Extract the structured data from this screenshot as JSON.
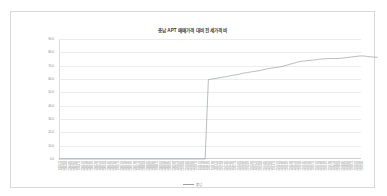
{
  "chart_data": {
    "type": "line",
    "title": "충남 APT 매매가격 대비 전세가격 비",
    "xlabel": "",
    "ylabel": "",
    "ylim": [
      0.0,
      90.0
    ],
    "yticks": [
      0.0,
      10.0,
      20.0,
      30.0,
      40.0,
      50.0,
      60.0,
      70.0,
      80.0,
      90.0
    ],
    "ytick_labels": [
      "0.0",
      "10.0",
      "20.0",
      "30.0",
      "40.0",
      "50.0",
      "60.0",
      "70.0",
      "80.0",
      "90.0"
    ],
    "grid": true,
    "legend_position": "bottom",
    "series": [
      {
        "name": "충남",
        "color": "#9aa0a6",
        "categories": [
          "2003.11",
          "2004.01",
          "2004.03",
          "2004.05",
          "2004.07",
          "2004.09",
          "2004.11",
          "2005.01",
          "2005.03",
          "2005.05",
          "2005.07",
          "2005.09",
          "2005.11",
          "2006.01",
          "2006.03",
          "2006.05",
          "2006.07",
          "2006.09",
          "2006.11",
          "2007.01",
          "2007.03",
          "2007.05",
          "2007.07",
          "2007.09",
          "2007.11",
          "2008.01",
          "2008.03",
          "2008.05",
          "2008.07",
          "2008.09",
          "2008.11",
          "2009.01",
          "2009.03",
          "2009.05",
          "2009.07",
          "2009.09",
          "2009.11",
          "2010.01",
          "2010.03",
          "2010.05",
          "2010.07",
          "2010.09",
          "2010.11",
          "2011.01",
          "2011.03",
          "2011.05",
          "2011.07",
          "2011.09",
          "2011.11",
          "2012.01",
          "2012.03",
          "2012.05",
          "2012.07",
          "2012.09",
          "2012.11",
          "2013.01",
          "2013.03",
          "2013.05",
          "2013.07",
          "2013.09",
          "2013.11",
          "2014.01",
          "2014.03",
          "2014.05",
          "2014.07",
          "2014.09",
          "2014.11",
          "2015.01",
          "2015.03",
          "2015.05",
          "2015.07",
          "2015.09",
          "2015.11",
          "2016.01",
          "2016.03",
          "2016.05",
          "2016.07",
          "2016.09",
          "2016.11",
          "2017.01",
          "2017.03",
          "2017.05",
          "2017.07",
          "2017.09",
          "2017.11",
          "2018.01",
          "2018.03",
          "2018.05",
          "2018.07",
          "2018.09",
          "2018.11",
          "2019.01",
          "2019.03",
          "2019.05"
        ],
        "values": [
          0,
          0,
          0,
          0,
          0,
          0,
          0,
          0,
          0,
          0,
          0,
          0,
          0,
          0,
          0,
          0,
          0,
          0,
          0,
          0,
          0,
          0,
          0,
          0,
          0,
          0,
          0,
          0,
          0,
          0,
          0,
          0,
          0,
          0,
          0,
          0,
          0,
          0,
          0,
          0,
          0,
          0,
          0,
          0,
          0,
          0,
          59.5,
          60.0,
          60.3,
          60.8,
          61.2,
          61.5,
          62.0,
          62.6,
          63.0,
          63.3,
          63.9,
          64.5,
          64.8,
          65.3,
          65.6,
          66.0,
          66.4,
          67.0,
          67.6,
          68.0,
          68.4,
          68.7,
          69.0,
          69.6,
          70.3,
          71.0,
          71.6,
          72.3,
          73.0,
          73.4,
          73.6,
          73.9,
          74.1,
          74.4,
          74.8,
          75.0,
          75.2,
          75.3,
          75.4,
          75.3,
          75.4,
          75.6,
          75.9,
          76.2,
          76.5,
          76.8,
          77.1,
          77.3,
          77.2,
          76.9,
          76.6,
          76.4,
          76.3
        ]
      }
    ]
  },
  "legend": {
    "label": "충남"
  }
}
